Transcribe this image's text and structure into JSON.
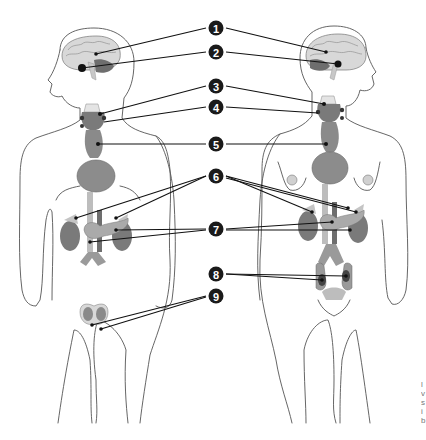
{
  "diagram": {
    "figures": [
      {
        "id": "male",
        "position": "left"
      },
      {
        "id": "female",
        "position": "right"
      }
    ],
    "callouts": [
      {
        "number": "1",
        "organ": "hypothalamus"
      },
      {
        "number": "2",
        "organ": "pituitary gland"
      },
      {
        "number": "3",
        "organ": "parathyroid glands (upper)"
      },
      {
        "number": "4",
        "organ": "thyroid / parathyroid glands"
      },
      {
        "number": "5",
        "organ": "thymus"
      },
      {
        "number": "6",
        "organ": "adrenal glands"
      },
      {
        "number": "7",
        "organ": "pancreas"
      },
      {
        "number": "8",
        "organ": "ovaries"
      },
      {
        "number": "9",
        "organ": "testes"
      }
    ],
    "colors": {
      "organ_fill": "#8a8a8a",
      "organ_light": "#bdbdbd",
      "organ_dark": "#5a5a5a",
      "outline": "#555555",
      "badge": "#1a1a1a",
      "background": "#ffffff"
    },
    "edge_text": "l\nv\ns\ni\nb"
  }
}
